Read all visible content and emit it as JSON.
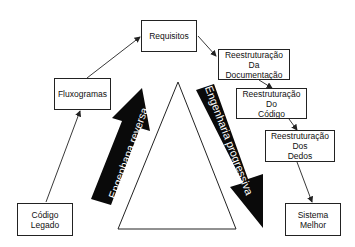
{
  "diagram": {
    "nodes": {
      "requisitos": {
        "label": "Requisitos"
      },
      "fluxogramas": {
        "label": "Fluxogramas"
      },
      "codigo_legado": {
        "line1": "Código",
        "line2": "Legado"
      },
      "reest_doc": {
        "line1": "Reestruturação",
        "line2": "Da",
        "line3": "Documentação"
      },
      "reest_codigo": {
        "line1": "Reestruturação",
        "line2": "Do",
        "line3": "Código"
      },
      "reest_dados": {
        "line1": "Reestruturação",
        "line2": "Dos",
        "line3": "Dedos"
      },
      "sistema_melhor": {
        "line1": "Sistema",
        "line2": "Melhor"
      }
    },
    "arrows": {
      "reverse": {
        "label": "Engenhana reversa"
      },
      "progressive": {
        "label": "Engenharia progressiva"
      }
    },
    "edges": [
      [
        "codigo_legado",
        "fluxogramas"
      ],
      [
        "fluxogramas",
        "requisitos"
      ],
      [
        "requisitos",
        "reest_doc"
      ],
      [
        "reest_doc",
        "reest_codigo"
      ],
      [
        "reest_codigo",
        "reest_dados"
      ],
      [
        "reest_dados",
        "sistema_melhor"
      ]
    ],
    "colors": {
      "line": "#222222",
      "arrow_fill": "#0a0a0a",
      "text": "#111111"
    }
  }
}
